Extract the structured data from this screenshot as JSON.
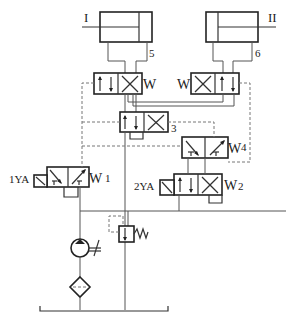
{
  "diagram": {
    "type": "hydraulic-circuit-schematic",
    "cylinders": [
      {
        "id": "I",
        "label": "I"
      },
      {
        "id": "II",
        "label": "II"
      }
    ],
    "valves": [
      {
        "id": "1",
        "label": "1",
        "solenoid": "1YA"
      },
      {
        "id": "2",
        "label": "2",
        "solenoid": "2YA"
      },
      {
        "id": "3",
        "label": "3"
      },
      {
        "id": "4",
        "label": "4"
      },
      {
        "id": "5",
        "label": "5"
      },
      {
        "id": "6",
        "label": "6"
      }
    ],
    "labels": {
      "cyl_1": "I",
      "cyl_2": "II",
      "v1": "1",
      "v2": "2",
      "v3": "3",
      "v4": "4",
      "v5": "5",
      "v6": "6",
      "sol_1": "1YA",
      "sol_2": "2YA"
    },
    "components": [
      "pump",
      "filter",
      "relief-valve",
      "tank"
    ]
  }
}
